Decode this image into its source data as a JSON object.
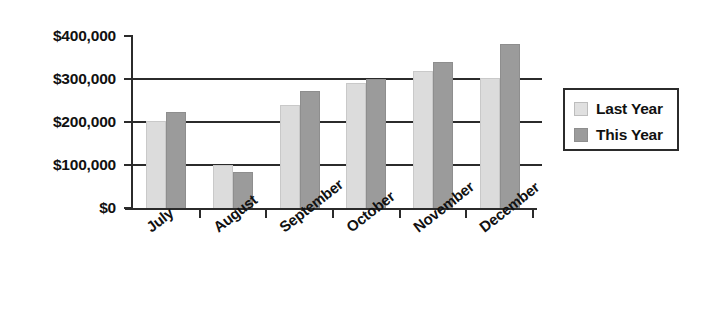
{
  "chart_data": {
    "type": "bar",
    "title": "",
    "subtitle": "",
    "xlabel": "",
    "ylabel": "",
    "categories": [
      "July",
      "August",
      "September",
      "October",
      "November",
      "December"
    ],
    "series": [
      {
        "name": "Last Year",
        "color": "#dcdcdc",
        "values": [
          202000,
          100000,
          240000,
          290000,
          318000,
          302000
        ]
      },
      {
        "name": "This Year",
        "color": "#9b9b9b",
        "values": [
          224000,
          83000,
          272000,
          300000,
          340000,
          382000
        ]
      }
    ],
    "ylim": [
      0,
      400000
    ],
    "ytick_values": [
      0,
      100000,
      200000,
      300000,
      400000
    ],
    "ytick_labels": [
      "$0",
      "$100,000",
      "$200,000",
      "$300,000",
      "$400,000"
    ],
    "grid": "horizontal",
    "legend_position": "right",
    "legend_entries": [
      "Last Year",
      "This Year"
    ],
    "xtick_label_rotation": -38
  },
  "legend": {
    "items": [
      {
        "label": "Last Year",
        "swatch": "light-gray-swatch"
      },
      {
        "label": "This Year",
        "swatch": "dark-gray-swatch"
      }
    ]
  }
}
